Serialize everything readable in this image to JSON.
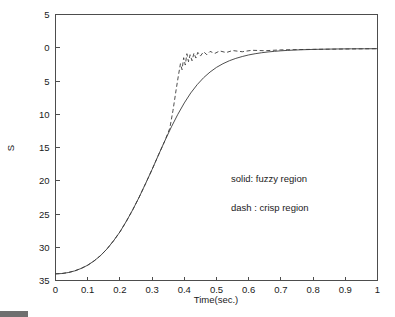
{
  "chart_data": {
    "type": "line",
    "title": "",
    "xlabel": "Time(sec.)",
    "ylabel": "S",
    "xlim": [
      0,
      1
    ],
    "ylim": [
      35,
      -5
    ],
    "y_axis_inverted": true,
    "grid": false,
    "legend_position": "inside-center-right",
    "x_ticks": [
      0,
      0.1,
      0.2,
      0.3,
      0.4,
      0.5,
      0.6,
      0.7,
      0.8,
      0.9,
      1
    ],
    "x_tick_labels": [
      "0",
      "0.1",
      "0.2",
      "0.3",
      "0.4",
      "0.5",
      "0.6",
      "0.7",
      "0.8",
      "0.9",
      "1"
    ],
    "y_ticks": [
      -5,
      0,
      5,
      10,
      15,
      20,
      25,
      30,
      35
    ],
    "y_tick_labels": [
      "5",
      "0",
      "5",
      "10",
      "15",
      "20",
      "25",
      "30",
      "35"
    ],
    "annotations": [
      {
        "text": "solid: fuzzy region",
        "x": 0.545,
        "y": 20.2
      },
      {
        "text": "dash : crisp region",
        "x": 0.545,
        "y": 24.6
      }
    ],
    "series": [
      {
        "name": "solid: fuzzy region",
        "style": "solid",
        "color": "#3a3a3a",
        "x": [
          0.0,
          0.02,
          0.04,
          0.06,
          0.08,
          0.1,
          0.12,
          0.14,
          0.16,
          0.18,
          0.2,
          0.22,
          0.24,
          0.26,
          0.28,
          0.3,
          0.32,
          0.34,
          0.36,
          0.38,
          0.4,
          0.42,
          0.44,
          0.46,
          0.48,
          0.5,
          0.52,
          0.54,
          0.56,
          0.58,
          0.6,
          0.62,
          0.64,
          0.66,
          0.68,
          0.7,
          0.72,
          0.74,
          0.76,
          0.78,
          0.8,
          0.84,
          0.88,
          0.92,
          0.96,
          1.0
        ],
        "y": [
          34.0,
          33.95,
          33.8,
          33.55,
          33.18,
          32.7,
          32.05,
          31.25,
          30.25,
          29.05,
          27.7,
          26.1,
          24.35,
          22.45,
          20.4,
          18.3,
          16.1,
          13.95,
          11.9,
          10.0,
          8.3,
          6.8,
          5.55,
          4.5,
          3.65,
          2.95,
          2.4,
          1.95,
          1.6,
          1.32,
          1.08,
          0.9,
          0.75,
          0.63,
          0.54,
          0.46,
          0.4,
          0.35,
          0.31,
          0.28,
          0.25,
          0.21,
          0.18,
          0.16,
          0.15,
          0.14
        ]
      },
      {
        "name": "dash : crisp region",
        "style": "dashed",
        "color": "#3a3a3a",
        "x": [
          0.0,
          0.02,
          0.04,
          0.06,
          0.08,
          0.1,
          0.12,
          0.14,
          0.16,
          0.18,
          0.2,
          0.22,
          0.24,
          0.26,
          0.28,
          0.3,
          0.32,
          0.34,
          0.355,
          0.365,
          0.375,
          0.382,
          0.388,
          0.393,
          0.398,
          0.403,
          0.408,
          0.413,
          0.418,
          0.424,
          0.43,
          0.436,
          0.442,
          0.45,
          0.46,
          0.47,
          0.48,
          0.495,
          0.51,
          0.53,
          0.55,
          0.58,
          0.61,
          0.65,
          0.7,
          0.75,
          0.8,
          0.86,
          0.92,
          1.0
        ],
        "y": [
          34.0,
          33.95,
          33.8,
          33.55,
          33.18,
          32.7,
          32.05,
          31.25,
          30.25,
          29.05,
          27.7,
          26.1,
          24.35,
          22.45,
          20.4,
          18.3,
          16.1,
          13.95,
          12.1,
          9.4,
          6.2,
          4.1,
          2.4,
          3.3,
          1.5,
          2.6,
          0.9,
          2.1,
          1.05,
          1.95,
          0.8,
          1.55,
          0.7,
          1.25,
          0.6,
          1.05,
          0.55,
          0.85,
          0.48,
          0.72,
          0.42,
          0.6,
          0.38,
          0.45,
          0.32,
          0.28,
          0.24,
          0.21,
          0.18,
          0.14
        ]
      }
    ]
  },
  "figure": {
    "background_color": "#ffffff",
    "axis_color": "#4d4d4d",
    "text_color": "#1a1a1a"
  }
}
